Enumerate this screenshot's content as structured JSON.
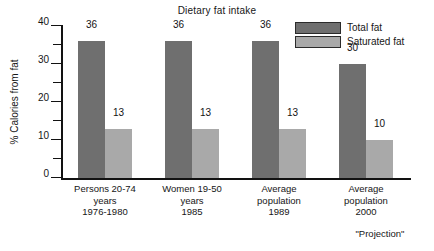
{
  "chart_data": {
    "type": "bar",
    "title": "Dietary fat intake",
    "xlabel": "",
    "ylabel": "% Calories from fat",
    "ylim": [
      0,
      40
    ],
    "ytick_labels": [
      "0",
      "10",
      "20",
      "30",
      "40"
    ],
    "ytick_values": [
      0,
      10,
      20,
      30,
      40
    ],
    "minor_tick_values": [
      5,
      15,
      25,
      35
    ],
    "grid": false,
    "legend_position": "top-right",
    "categories": [
      "Persons 20-74\nyears\n1976-1980",
      "Women 19-50\nyears\n1985",
      "Average\npopulation\n1989",
      "Average\npopulation\n2000"
    ],
    "series": [
      {
        "name": "Total fat",
        "values": [
          36,
          36,
          36,
          30
        ],
        "color": "#6f6f6f"
      },
      {
        "name": "Saturated fat",
        "values": [
          13,
          13,
          13,
          10
        ],
        "color": "#a9a9a9"
      }
    ],
    "annotations": [
      {
        "text": "\"Projection\"",
        "target_category": "Average\npopulation\n2000"
      }
    ]
  },
  "legend": {
    "items": [
      {
        "label": "Total fat"
      },
      {
        "label": "Saturated fat"
      }
    ]
  },
  "footnote": {
    "text": "\"Projection\""
  }
}
